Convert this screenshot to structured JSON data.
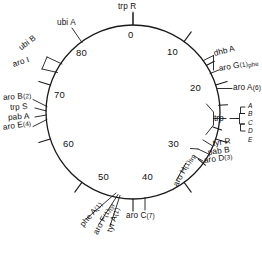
{
  "figure": {
    "type": "circular-genetic-map",
    "organism_map_title": "",
    "units": "minutes",
    "stroke_color": "#1a1a1a",
    "background_color": "#ffffff"
  },
  "circle": {
    "center_x": 133,
    "center_y": 112,
    "radius": 87
  },
  "scale_ticks": [
    {
      "label": "0",
      "minutes": 0,
      "angle_deg": 0
    },
    {
      "label": "10",
      "minutes": 10,
      "angle_deg": 36
    },
    {
      "label": "20",
      "minutes": 20,
      "angle_deg": 72
    },
    {
      "label": "30",
      "minutes": 30,
      "angle_deg": 108
    },
    {
      "label": "40",
      "minutes": 40,
      "angle_deg": 144
    },
    {
      "label": "50",
      "minutes": 50,
      "angle_deg": 180
    },
    {
      "label": "60",
      "minutes": 60,
      "angle_deg": 216
    },
    {
      "label": "70",
      "minutes": 70,
      "angle_deg": 252
    },
    {
      "label": "80",
      "minutes": 80,
      "angle_deg": 288
    }
  ],
  "genes": [
    {
      "id": "trpR",
      "text": "trp R",
      "count": "",
      "subscript": ""
    },
    {
      "id": "dhbA",
      "text": "dhb A",
      "count": "",
      "subscript": ""
    },
    {
      "id": "aroG",
      "text": "aro G",
      "count": "(1)",
      "subscript": "phe"
    },
    {
      "id": "aroA",
      "text": "aro A",
      "count": "(6)",
      "subscript": ""
    },
    {
      "id": "trp",
      "text": "trp",
      "count": "",
      "subscript": ""
    },
    {
      "id": "tyrR",
      "text": "tyr R",
      "count": "",
      "subscript": ""
    },
    {
      "id": "pabB",
      "text": "pab B",
      "count": "",
      "subscript": ""
    },
    {
      "id": "aroD",
      "text": "aro D",
      "count": "(3)",
      "subscript": ""
    },
    {
      "id": "aroH",
      "text": "aro H",
      "count": "(1)",
      "subscript": "trp"
    },
    {
      "id": "aroC",
      "text": "aro C",
      "count": "(7)",
      "subscript": ""
    },
    {
      "id": "tyrA",
      "text": "tyr A",
      "count": "(1)",
      "subscript": ""
    },
    {
      "id": "aroF",
      "text": "aro F",
      "count": "(1)",
      "subscript": "tyr"
    },
    {
      "id": "pheA",
      "text": "phe A",
      "count": "(1)",
      "subscript": ""
    },
    {
      "id": "aroE",
      "text": "aro E",
      "count": "(4)",
      "subscript": ""
    },
    {
      "id": "pabA",
      "text": "pab A",
      "count": "",
      "subscript": ""
    },
    {
      "id": "trpS",
      "text": "trp S",
      "count": "",
      "subscript": ""
    },
    {
      "id": "aroB",
      "text": "aro B",
      "count": "(2)",
      "subscript": ""
    },
    {
      "id": "aroI",
      "text": "aro I",
      "count": "",
      "subscript": ""
    },
    {
      "id": "ubiB",
      "text": "ubi B",
      "count": "",
      "subscript": ""
    },
    {
      "id": "ubiA",
      "text": "ubi A",
      "count": "",
      "subscript": ""
    }
  ],
  "trp_operon_bracket": {
    "label": "trp",
    "letters": [
      "A",
      "B",
      "C",
      "D",
      "E"
    ]
  }
}
